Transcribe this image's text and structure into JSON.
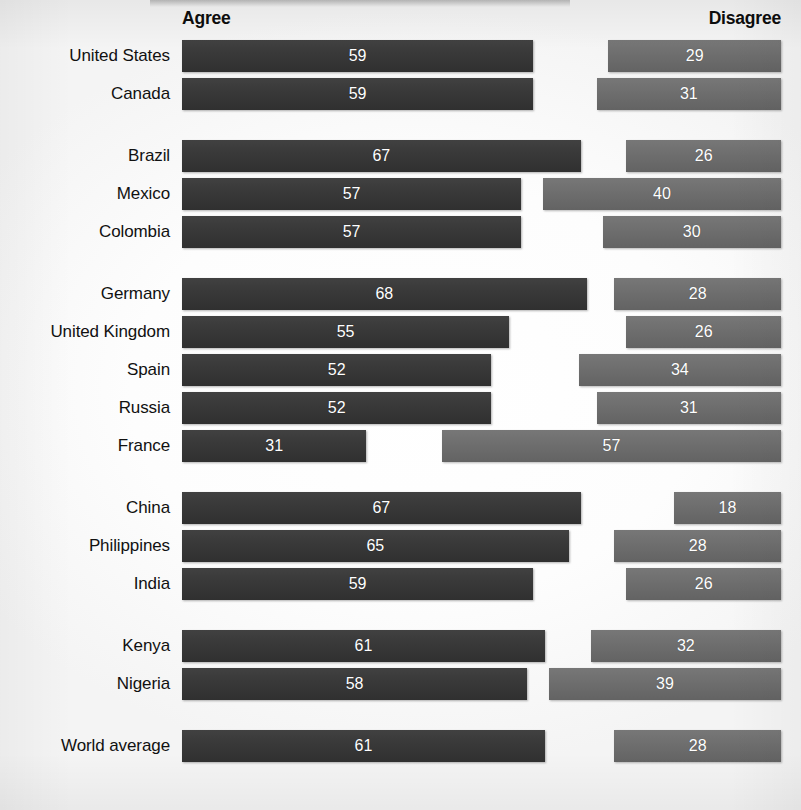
{
  "header": {
    "agree_label": "Agree",
    "disagree_label": "Disagree"
  },
  "colors": {
    "agree_bar": "#3a3a3a",
    "disagree_bar": "#6e6e6e",
    "value_text": "#ffffff",
    "label_text": "#111111",
    "background": "#ffffff"
  },
  "chart_data": {
    "type": "bar",
    "title": "",
    "subtitle": "",
    "xlabel": "",
    "ylabel": "",
    "orientation": "horizontal",
    "layout": "diverging-paired",
    "grid": false,
    "legend_position": "top",
    "axis_range": [
      0,
      100
    ],
    "value_unit": "percent",
    "legend": [
      "Agree",
      "Disagree"
    ],
    "categories": [
      "United States",
      "Canada",
      "Brazil",
      "Mexico",
      "Colombia",
      "Germany",
      "United Kingdom",
      "Spain",
      "Russia",
      "France",
      "China",
      "Philippines",
      "India",
      "Kenya",
      "Nigeria",
      "World average"
    ],
    "series": [
      {
        "name": "Agree",
        "values": [
          59,
          59,
          67,
          57,
          57,
          68,
          55,
          52,
          52,
          31,
          67,
          65,
          59,
          61,
          58,
          61
        ]
      },
      {
        "name": "Disagree",
        "values": [
          29,
          31,
          26,
          40,
          30,
          28,
          26,
          34,
          31,
          57,
          18,
          28,
          26,
          32,
          39,
          28
        ]
      }
    ],
    "groups": [
      {
        "name": "north-america",
        "rows": [
          {
            "label": "United States",
            "agree": 59,
            "disagree": 29
          },
          {
            "label": "Canada",
            "agree": 59,
            "disagree": 31
          }
        ]
      },
      {
        "name": "latin-america",
        "rows": [
          {
            "label": "Brazil",
            "agree": 67,
            "disagree": 26
          },
          {
            "label": "Mexico",
            "agree": 57,
            "disagree": 40
          },
          {
            "label": "Colombia",
            "agree": 57,
            "disagree": 30
          }
        ]
      },
      {
        "name": "europe",
        "rows": [
          {
            "label": "Germany",
            "agree": 68,
            "disagree": 28
          },
          {
            "label": "United Kingdom",
            "agree": 55,
            "disagree": 26
          },
          {
            "label": "Spain",
            "agree": 52,
            "disagree": 34
          },
          {
            "label": "Russia",
            "agree": 52,
            "disagree": 31
          },
          {
            "label": "France",
            "agree": 31,
            "disagree": 57
          }
        ]
      },
      {
        "name": "asia",
        "rows": [
          {
            "label": "China",
            "agree": 67,
            "disagree": 18
          },
          {
            "label": "Philippines",
            "agree": 65,
            "disagree": 28
          },
          {
            "label": "India",
            "agree": 59,
            "disagree": 26
          }
        ]
      },
      {
        "name": "africa",
        "rows": [
          {
            "label": "Kenya",
            "agree": 61,
            "disagree": 32
          },
          {
            "label": "Nigeria",
            "agree": 58,
            "disagree": 39
          }
        ]
      },
      {
        "name": "summary",
        "rows": [
          {
            "label": "World average",
            "agree": 61,
            "disagree": 28
          }
        ]
      }
    ]
  }
}
